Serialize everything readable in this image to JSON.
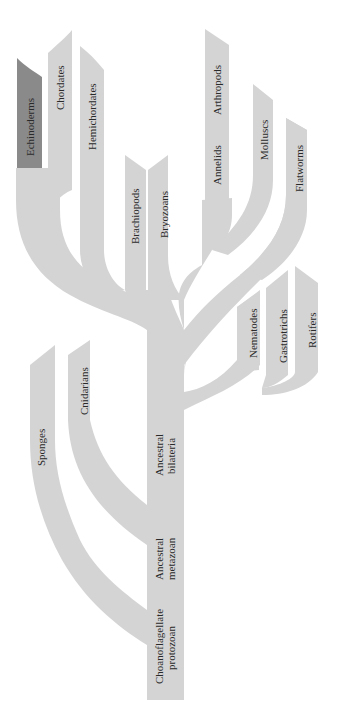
{
  "colors": {
    "branch": "#d4d4d4",
    "highlight": "#8a8a8a",
    "background": "#ffffff",
    "text": "#2a2a2a"
  },
  "tree": {
    "root": {
      "label_line1": "Choanoflagellate",
      "label_line2": "protozoan"
    },
    "nodes": {
      "metazoan": {
        "label_line1": "Ancestral",
        "label_line2": "metazoan"
      },
      "bilateria": {
        "label_line1": "Ancestral",
        "label_line2": "bilateria"
      }
    },
    "leaves": [
      {
        "id": "echinoderms",
        "label": "Echinoderms",
        "highlighted": true
      },
      {
        "id": "chordates",
        "label": "Chordates",
        "highlighted": false
      },
      {
        "id": "hemichordates",
        "label": "Hemichordates",
        "highlighted": false
      },
      {
        "id": "brachiopods",
        "label": "Brachiopods",
        "highlighted": false
      },
      {
        "id": "bryozoans",
        "label": "Bryozoans",
        "highlighted": false
      },
      {
        "id": "annelids",
        "label": "Annelids",
        "highlighted": false
      },
      {
        "id": "arthropods",
        "label": "Arthropods",
        "highlighted": false
      },
      {
        "id": "molluscs",
        "label": "Molluscs",
        "highlighted": false
      },
      {
        "id": "flatworms",
        "label": "Flatworms",
        "highlighted": false
      },
      {
        "id": "nematodes",
        "label": "Nematodes",
        "highlighted": false
      },
      {
        "id": "gastrotrichs",
        "label": "Gastrotrichs",
        "highlighted": false
      },
      {
        "id": "rotifers",
        "label": "Rotifers",
        "highlighted": false
      },
      {
        "id": "cnidarians",
        "label": "Cnidarians",
        "highlighted": false
      },
      {
        "id": "sponges",
        "label": "Sponges",
        "highlighted": false
      }
    ]
  }
}
